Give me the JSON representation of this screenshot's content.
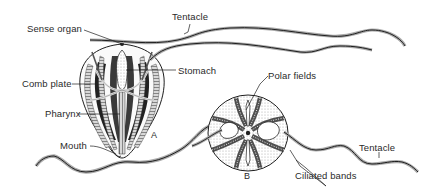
{
  "figure": {
    "panels": [
      {
        "id": "A",
        "label": "A"
      },
      {
        "id": "B",
        "label": "B"
      }
    ]
  },
  "labels": {
    "sense_organ": "Sense organ",
    "tentacle_top": "Tentacle",
    "stomach": "Stomach",
    "comb_plate": "Comb plate",
    "pharynx": "Pharynx",
    "mouth": "Mouth",
    "polar_fields": "Polar fields",
    "tentacle_right": "Tentacle",
    "ciliated_bands": "Ciliated bands"
  },
  "colors": {
    "ink": "#1e1e1e",
    "shade": "#8a8a8a",
    "background": "#ffffff"
  }
}
